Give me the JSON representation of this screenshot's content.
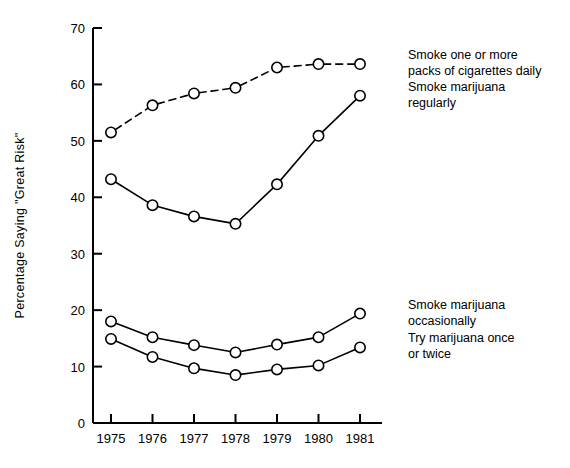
{
  "chart_data": {
    "type": "line",
    "title": "",
    "xlabel": "",
    "ylabel": "Percentage Saying \"Great Risk\"",
    "categories": [
      "1975",
      "1976",
      "1977",
      "1978",
      "1979",
      "1980",
      "1981"
    ],
    "x": [
      1975,
      1976,
      1977,
      1978,
      1979,
      1980,
      1981
    ],
    "ylim": [
      0,
      70
    ],
    "yticks": [
      0,
      10,
      20,
      30,
      40,
      50,
      60,
      70
    ],
    "ytick_labels": [
      "0",
      "10",
      "20",
      "30",
      "40",
      "50",
      "60",
      "70"
    ],
    "grid": false,
    "legend_position": "right-inline",
    "series": [
      {
        "name": "Smoke one or more packs of cigarettes daily",
        "label_line1": "Smoke one or more",
        "label_line2": "packs of cigarettes daily",
        "style": "dashed",
        "marker": "open-circle",
        "color": "#000000",
        "values": [
          51.5,
          56.3,
          58.4,
          59.4,
          63.0,
          63.6,
          63.6
        ]
      },
      {
        "name": "Smoke marijuana regularly",
        "label_line1": "Smoke marijuana",
        "label_line2": "regularly",
        "style": "solid",
        "marker": "open-circle",
        "color": "#000000",
        "values": [
          43.2,
          38.6,
          36.6,
          35.3,
          42.3,
          50.9,
          58.0
        ]
      },
      {
        "name": "Smoke marijuana occasionally",
        "label_line1": "Smoke marijuana",
        "label_line2": "occasionally",
        "style": "solid",
        "marker": "open-circle",
        "color": "#000000",
        "values": [
          18.0,
          15.2,
          13.8,
          12.5,
          13.9,
          15.2,
          19.4
        ]
      },
      {
        "name": "Try marijuana once or twice",
        "label_line1": "Try marijuana once",
        "label_line2": "or twice",
        "style": "solid",
        "marker": "open-circle",
        "color": "#000000",
        "values": [
          14.9,
          11.7,
          9.7,
          8.5,
          9.5,
          10.2,
          13.4
        ]
      }
    ],
    "legend_entries": [
      {
        "label_line1": "Smoke one or more",
        "label_line2": "packs of cigarettes daily",
        "anchor_value": 63.6,
        "anchor_year_index": 6
      },
      {
        "label_line1": "Smoke marijuana",
        "label_line2": "regularly",
        "anchor_value": 58.0,
        "anchor_year_index": 6
      },
      {
        "label_line1": "Smoke marijuana",
        "label_line2": "occasionally",
        "anchor_value": 19.4,
        "anchor_year_index": 6
      },
      {
        "label_line1": "Try marijuana once",
        "label_line2": "or twice",
        "anchor_value": 13.4,
        "anchor_year_index": 6
      }
    ]
  }
}
